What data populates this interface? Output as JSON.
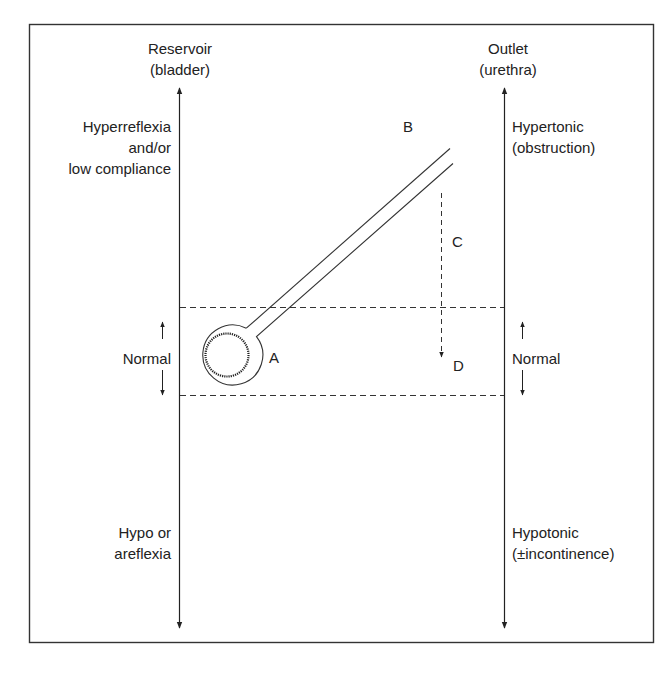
{
  "diagram": {
    "type": "schematic",
    "left_axis": {
      "title_line1": "Reservoir",
      "title_line2": "(bladder)",
      "top_label_line1": "Hyperreflexia",
      "top_label_line2": "and/or",
      "top_label_line3": "low compliance",
      "middle_label": "Normal",
      "bottom_label_line1": "Hypo or",
      "bottom_label_line2": "areflexia"
    },
    "right_axis": {
      "title_line1": "Outlet",
      "title_line2": "(urethra)",
      "top_label_line1": "Hypertonic",
      "top_label_line2": "(obstruction)",
      "middle_label": "Normal",
      "bottom_label_line1": "Hypotonic",
      "bottom_label_line2": "(±incontinence)"
    },
    "points": {
      "a": "A",
      "b": "B",
      "c": "C",
      "d": "D"
    },
    "colors": {
      "line": "#222222",
      "frame": "#333333",
      "background": "#ffffff"
    }
  }
}
